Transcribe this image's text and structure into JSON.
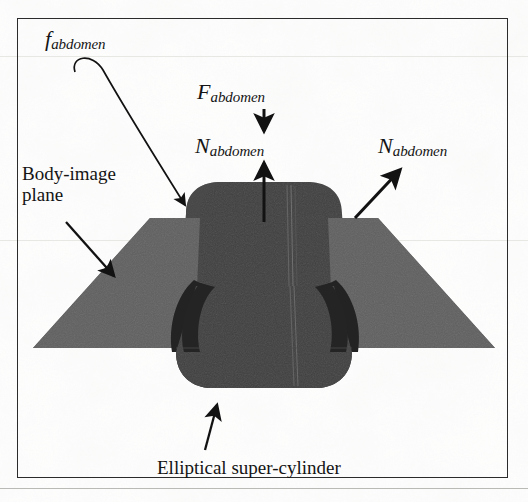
{
  "figure": {
    "type": "technical-illustration",
    "frame": {
      "border_color": "#2b2b2b"
    },
    "background_color": "#fdfdfc",
    "colors": {
      "cylinder_fill": "#3e3e3e",
      "cylinder_shadow": "#2a2a2a",
      "plane_fill": "#595959",
      "plane_fill_light": "#6a6a6a",
      "cavity_fill": "#232323",
      "ink": "#141414"
    }
  },
  "labels": {
    "friction": {
      "symbol": "f",
      "subscript": "abdomen"
    },
    "force": {
      "symbol": "F",
      "subscript": "abdomen"
    },
    "normal_top": {
      "symbol": "N",
      "subscript": "abdomen"
    },
    "normal_right": {
      "symbol": "N",
      "subscript": "abdomen"
    },
    "body_image_plane_line1": "Body-image",
    "body_image_plane_line2": "plane",
    "elliptical_super_cylinder": "Elliptical super-cylinder"
  },
  "annotations": {
    "arrows": [
      {
        "name": "friction-curved-arrow",
        "from": "f_abdomen label",
        "to": "upper-left shoulder of super-cylinder",
        "style": "curved"
      },
      {
        "name": "force-down-arrow",
        "from": "F_abdomen label",
        "to": "downward",
        "style": "straight-vertical"
      },
      {
        "name": "normal-up-arrow",
        "from": "top of super-cylinder",
        "to": "N_abdomen label",
        "style": "straight-vertical"
      },
      {
        "name": "normal-diagonal-arrow",
        "from": "right shoulder of super-cylinder",
        "to": "N_abdomen label",
        "style": "straight-diagonal"
      },
      {
        "name": "body-image-plane-arrow",
        "from": "Body-image plane label",
        "to": "left wing of plane",
        "style": "straight-diagonal"
      },
      {
        "name": "super-cylinder-arrow",
        "from": "Elliptical super-cylinder label",
        "to": "bottom of super-cylinder",
        "style": "straight-diagonal"
      }
    ]
  }
}
